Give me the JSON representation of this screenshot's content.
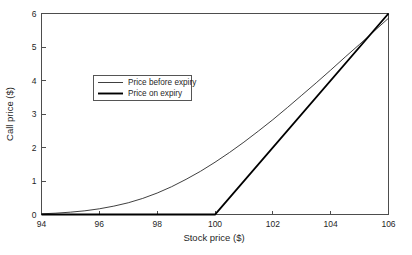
{
  "chart_data": {
    "type": "line",
    "title": "",
    "xlabel": "Stock price ($)",
    "ylabel": "Call price ($)",
    "xlim": [
      94,
      106
    ],
    "ylim": [
      0,
      6
    ],
    "xticks": [
      94,
      96,
      98,
      100,
      102,
      104,
      106
    ],
    "xtick_labels": [
      "94",
      "96",
      "98",
      "100",
      "102",
      "104",
      "106"
    ],
    "yticks": [
      0,
      1,
      2,
      3,
      4,
      5,
      6
    ],
    "ytick_labels": [
      "0",
      "1",
      "2",
      "3",
      "4",
      "5",
      "6"
    ],
    "grid": false,
    "legend_position": "upper left",
    "legend_entries": [
      "Price before expiry",
      "Price on expiry"
    ],
    "series": [
      {
        "name": "Price before expiry",
        "style": "thin",
        "color": "#2a2a2a",
        "x": [
          94,
          94.5,
          95,
          95.5,
          96,
          96.5,
          97,
          97.5,
          98,
          98.5,
          99,
          99.5,
          100,
          100.5,
          101,
          101.5,
          102,
          102.5,
          103,
          103.5,
          104,
          104.5,
          105,
          105.5,
          106
        ],
        "y": [
          0.02,
          0.04,
          0.07,
          0.11,
          0.17,
          0.25,
          0.35,
          0.48,
          0.64,
          0.83,
          1.05,
          1.29,
          1.56,
          1.85,
          2.16,
          2.49,
          2.83,
          3.19,
          3.56,
          3.93,
          4.31,
          4.7,
          5.08,
          5.47,
          5.86
        ]
      },
      {
        "name": "Price on expiry",
        "style": "thick",
        "color": "#000000",
        "x": [
          94,
          100,
          106
        ],
        "y": [
          0,
          0,
          6
        ]
      }
    ]
  },
  "figure": {
    "background_color": "#ffffff",
    "axis_color": "#4d4d4d"
  }
}
